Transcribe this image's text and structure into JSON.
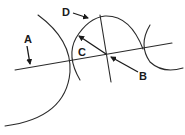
{
  "diagram": {
    "colors": {
      "stroke": "#2a2a2a",
      "label": "#1a1a1a",
      "background": "#ffffff"
    },
    "labels": {
      "A": "A",
      "B": "B",
      "C": "C",
      "D": "D"
    },
    "elements": {
      "main_line": {
        "x1": 15,
        "y1": 70,
        "x2": 172,
        "y2": 43
      },
      "perpendicular_line": {
        "x1": 100,
        "y1": 15,
        "x2": 111,
        "y2": 82
      },
      "center_point_B": {
        "x": 107,
        "y": 54
      }
    }
  }
}
